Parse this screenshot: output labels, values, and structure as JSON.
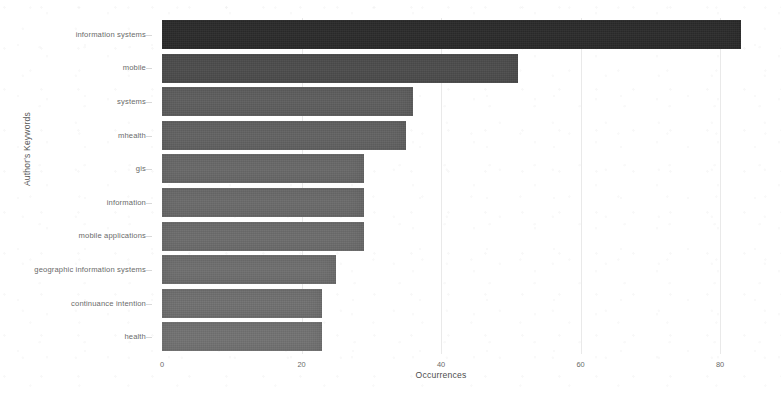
{
  "chart_data": {
    "type": "bar",
    "orientation": "horizontal",
    "title": "",
    "xlabel": "Occurrences",
    "ylabel": "Author's Keywords",
    "categories": [
      "information systems",
      "mobile",
      "systems",
      "mhealth",
      "gis",
      "information",
      "mobile applications",
      "geographic information systems",
      "continuance intention",
      "health"
    ],
    "values": [
      83,
      51,
      36,
      35,
      29,
      29,
      29,
      25,
      23,
      23
    ],
    "xlim": [
      0,
      80
    ],
    "xticks": [
      0,
      20,
      40,
      60,
      80
    ],
    "xtick_labels": [
      "0",
      "20",
      "40",
      "60",
      "80"
    ],
    "grid": true,
    "legend": "none",
    "bar_colors": [
      "#2c2c2c",
      "#4d4d4d",
      "#5f5f5f",
      "#636363",
      "#696969",
      "#6b6b6b",
      "#6d6d6d",
      "#6f6f6f",
      "#717171",
      "#737373"
    ]
  },
  "axes": {
    "x_title": "Occurrences",
    "y_title": "Author's Keywords"
  }
}
